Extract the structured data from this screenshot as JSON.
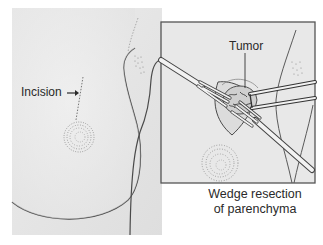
{
  "figure": {
    "main_view": {
      "label_incision": "Incision",
      "arrow": "arrow-right-icon"
    },
    "inset_view": {
      "label_tumor": "Tumor",
      "caption_line1": "Wedge resection",
      "caption_line2": "of parenchyma"
    },
    "colors": {
      "background_panel": "#e6e6e6",
      "skin_light": "#efefef",
      "outline": "#4a4a4a",
      "inset_border": "#555555",
      "text": "#2a2a2a"
    }
  }
}
